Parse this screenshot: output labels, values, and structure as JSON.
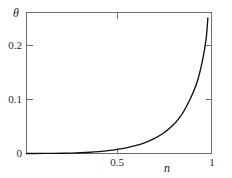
{
  "clipped_header_text": "· · ·  ···· ··  ··· ···· · ···· ··",
  "axes": {
    "y_title": "θ",
    "x_title": "n",
    "y_ticks": [
      {
        "value": 0,
        "label": "0"
      },
      {
        "value": 0.1,
        "label": "0.1"
      },
      {
        "value": 0.2,
        "label": "0.2"
      }
    ],
    "x_ticks": [
      {
        "value": 0.5,
        "label": "0.5"
      },
      {
        "value": 1,
        "label": "1"
      }
    ]
  },
  "style": {
    "curve_color": "#111111",
    "frame_color": "#6e6e6e",
    "background": "#ffffff"
  },
  "chart_data": {
    "type": "line",
    "title": "",
    "subtitle": "",
    "xlabel": "n",
    "ylabel": "θ",
    "xlim": [
      0,
      1.02
    ],
    "ylim": [
      0,
      0.262
    ],
    "grid": false,
    "legend": null,
    "legend_position": "none",
    "x_tick_labels": [
      "0.5",
      "1"
    ],
    "y_tick_labels": [
      "0",
      "0.1",
      "0.2"
    ],
    "series": [
      {
        "name": "theta",
        "x": [
          0.0,
          0.05,
          0.1,
          0.15,
          0.2,
          0.25,
          0.3,
          0.35,
          0.4,
          0.45,
          0.5,
          0.55,
          0.6,
          0.65,
          0.7,
          0.75,
          0.8,
          0.85,
          0.9,
          0.94,
          0.97,
          0.99,
          1.0
        ],
        "y": [
          0.0,
          0.0,
          0.0001,
          0.0002,
          0.0004,
          0.0008,
          0.0014,
          0.0023,
          0.0036,
          0.0053,
          0.0076,
          0.0106,
          0.0146,
          0.0199,
          0.027,
          0.0366,
          0.05,
          0.0694,
          0.0995,
          0.132,
          0.172,
          0.212,
          0.252
        ]
      }
    ],
    "annotations": []
  }
}
